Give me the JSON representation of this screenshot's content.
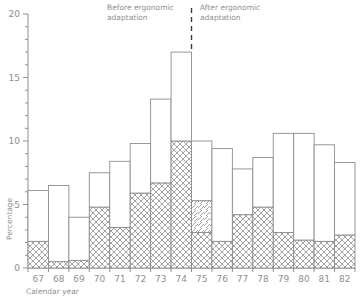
{
  "chart_data": {
    "type": "bar",
    "subtype": "stacked-bar",
    "title": "",
    "xlabel": "Calendar year",
    "ylabel": "Percentage",
    "ylim": [
      0,
      20
    ],
    "ytick_labels": [
      "0",
      "5",
      "10",
      "15",
      "20"
    ],
    "ytick_values": [
      0,
      5,
      10,
      15,
      20
    ],
    "yminor_step": 1,
    "grid": false,
    "legend_position": "none",
    "categories": [
      "67",
      "68",
      "69",
      "70",
      "71",
      "72",
      "73",
      "74",
      "75",
      "76",
      "77",
      "78",
      "79",
      "80",
      "81",
      "82"
    ],
    "series": [
      {
        "name": "Lower segment (cross-hatched)",
        "pattern": "cross-hatch",
        "values": [
          2.1,
          0.5,
          0.6,
          4.8,
          3.2,
          5.9,
          6.7,
          10.0,
          2.8,
          2.1,
          4.2,
          4.8,
          2.8,
          2.2,
          2.1,
          2.6
        ]
      },
      {
        "name": "Middle segment (diagonal-hatched)",
        "pattern": "diagonal-hatch",
        "values": [
          0,
          0,
          0,
          0,
          0,
          0,
          0,
          0,
          2.5,
          0,
          0,
          0,
          0,
          0,
          0,
          0
        ]
      },
      {
        "name": "Upper segment (unfilled)",
        "pattern": "blank",
        "values": [
          4.0,
          6.0,
          3.4,
          2.7,
          5.2,
          3.9,
          6.6,
          7.0,
          4.7,
          7.3,
          3.6,
          3.9,
          7.8,
          8.4,
          7.6,
          5.7
        ]
      }
    ],
    "totals": [
      6.1,
      6.5,
      4.0,
      7.5,
      8.4,
      9.8,
      13.3,
      17.0,
      10.0,
      9.4,
      7.8,
      8.7,
      10.6,
      10.6,
      9.7,
      8.3
    ],
    "annotations": [
      {
        "name": "before-label",
        "text_line1": "Before ergonomic",
        "text_line2": "adaptation"
      },
      {
        "name": "after-label",
        "text_line1": "After ergonomic",
        "text_line2": "adaptation"
      },
      {
        "name": "divider",
        "text": "",
        "x_between": [
          "74",
          "75"
        ],
        "style": "dashed-vertical"
      }
    ]
  },
  "colors": {
    "axis": "#909090",
    "text": "#8f8f8f",
    "bar_outline": "#8d8d8d",
    "divider": "#3a3a3a",
    "background": "#ffffff"
  }
}
